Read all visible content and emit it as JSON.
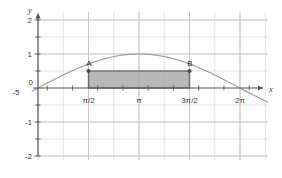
{
  "figure": {
    "background": "#ffffff",
    "grid_color": "#d8d8d8",
    "grid_major_color": "#c2c2c2",
    "axis_color": "#555555",
    "curve_color": "#9a9a9a",
    "shade_fill": "#a8a8a8",
    "shade_edge": "#6d6d6d"
  },
  "axes": {
    "x_name": "x",
    "y_name": "y",
    "origin_label": "0",
    "x_left_label": "-5",
    "x_ticks": [
      {
        "label": "π/2",
        "value": 1.5708
      },
      {
        "label": "π",
        "value": 3.1416
      },
      {
        "label": "3π/2",
        "value": 4.7124
      },
      {
        "label": "2π",
        "value": 6.2832
      }
    ],
    "y_ticks": [
      {
        "label": "2",
        "value": 2
      },
      {
        "label": "1",
        "value": 1
      },
      {
        "label": "-1",
        "value": -1
      },
      {
        "label": "-2",
        "value": -2
      }
    ],
    "xlim": [
      -0.9,
      7.3
    ],
    "ylim": [
      -2.35,
      2.45
    ]
  },
  "points": [
    {
      "name": "A",
      "label": "A",
      "x": 1.5708,
      "y": 0.5
    },
    {
      "name": "B",
      "label": "B",
      "x": 4.7124,
      "y": 0.5
    }
  ],
  "chart_data": {
    "type": "line",
    "title": "",
    "xlabel": "x",
    "ylabel": "y",
    "xlim": [
      -0.9,
      7.3
    ],
    "ylim": [
      -2.35,
      2.45
    ],
    "grid": true,
    "legend": null,
    "xticks": [
      "π/2",
      "π",
      "3π/2",
      "2π"
    ],
    "xtick_values": [
      1.5708,
      3.1416,
      4.7124,
      6.2832
    ],
    "yticks": [
      "2",
      "1",
      "-1",
      "-2"
    ],
    "ytick_values": [
      2,
      1,
      -1,
      -2
    ],
    "series": [
      {
        "name": "y = sin(x)",
        "type": "line",
        "color": "#9a9a9a",
        "x": [
          0,
          0.3927,
          0.7854,
          1.1781,
          1.5708,
          1.9635,
          2.3562,
          2.7489,
          3.1416,
          3.5343,
          3.927,
          4.3197,
          4.7124,
          5.1051,
          5.4978,
          5.8905,
          6.2832
        ],
        "y": [
          0,
          0.3827,
          0.7071,
          0.9239,
          1.0,
          0.9239,
          0.7071,
          0.3827,
          0.0,
          -0.3827,
          -0.7071,
          -0.9239,
          -1.0,
          -0.9239,
          -0.7071,
          -0.3827,
          0.0
        ],
        "note": "curve drawn shifted so that it peaks near x=π at y≈1"
      }
    ],
    "shaded_region": {
      "type": "rectangle",
      "x_from": 1.5708,
      "x_to": 4.7124,
      "y_from": 0,
      "y_to": 0.5,
      "fill": "#a8a8a8",
      "edge": "#6d6d6d",
      "label": "region between A and B"
    },
    "annotations": [
      {
        "text": "A",
        "x": 1.5708,
        "y": 0.5
      },
      {
        "text": "B",
        "x": 4.7124,
        "y": 0.5
      }
    ]
  }
}
